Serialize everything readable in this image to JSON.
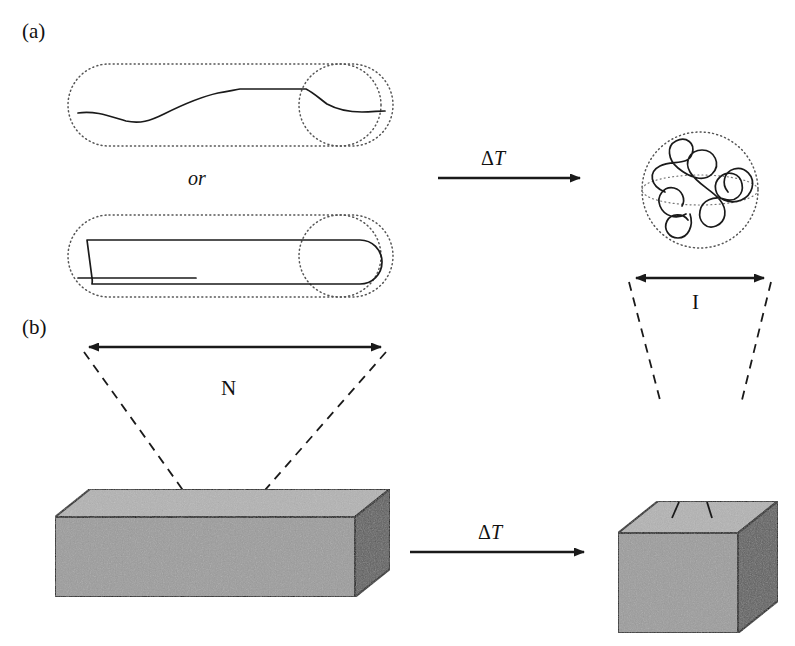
{
  "figure": {
    "type": "diagram",
    "background_color": "#ffffff",
    "ink_color": "#1a1a1a"
  },
  "panels": [
    {
      "id": "a",
      "label": "(a)",
      "connector_label": "ΔT",
      "or_label": "or",
      "left_states": [
        {
          "name": "extended-chain-capsule",
          "kind": "capsule-with-end-circle",
          "chain": "wavy extended single chain"
        },
        {
          "name": "folded-chain-capsule",
          "kind": "capsule-with-end-circle",
          "chain": "hairpin folded chain"
        }
      ],
      "right_state": {
        "name": "coiled-globule-sphere",
        "kind": "dotted-sphere-with-equator",
        "chain": "random coil"
      },
      "measure_label": "I"
    },
    {
      "id": "b",
      "label": "(b)",
      "connector_label": "ΔT",
      "left_state": {
        "name": "rectangular-bar",
        "kind": "3d-box",
        "measure_label": "N"
      },
      "right_state": {
        "name": "cube",
        "kind": "3d-cube"
      }
    }
  ],
  "labels": {
    "panel_a": "(a)",
    "panel_b": "(b)",
    "or": "or",
    "delta_t_top": "ΔT",
    "delta_t_bottom": "ΔT",
    "measure_l": "I",
    "measure_n": "N"
  },
  "colors": {
    "ink": "#1a1a1a",
    "box_top": "#b3b3b3",
    "box_front": "#9c9c9c",
    "box_side": "#5e5e5e",
    "box_edge": "#111111",
    "dotted": "#555555",
    "background": "#ffffff"
  },
  "geometry": {
    "capsule_top": {
      "x": 68,
      "y": 64,
      "width": 325,
      "height": 82,
      "end_circle_cx": 340,
      "end_circle_r": 41
    },
    "capsule_bottom": {
      "x": 68,
      "y": 215,
      "width": 325,
      "height": 82,
      "end_circle_cx": 340,
      "end_circle_r": 41
    },
    "sphere": {
      "cx": 700,
      "cy": 190,
      "r": 58
    },
    "arrow_top": {
      "x1": 438,
      "y1": 178,
      "x2": 580,
      "y2": 178
    },
    "arrow_bottom": {
      "x1": 410,
      "y1": 552,
      "x2": 588,
      "y2": 552
    },
    "dim_arrow_n": {
      "x1": 85,
      "y1": 347,
      "x2": 385,
      "y2": 347
    },
    "dim_arrow_l": {
      "x1": 632,
      "y1": 278,
      "x2": 768,
      "y2": 278
    },
    "bar": {
      "x": 55,
      "y": 505,
      "w": 300,
      "h": 80,
      "depth_x": 35,
      "depth_y": 28
    },
    "cube": {
      "x": 618,
      "y": 500,
      "w": 120,
      "h": 120,
      "depth_x": 40,
      "depth_y": 32
    }
  }
}
